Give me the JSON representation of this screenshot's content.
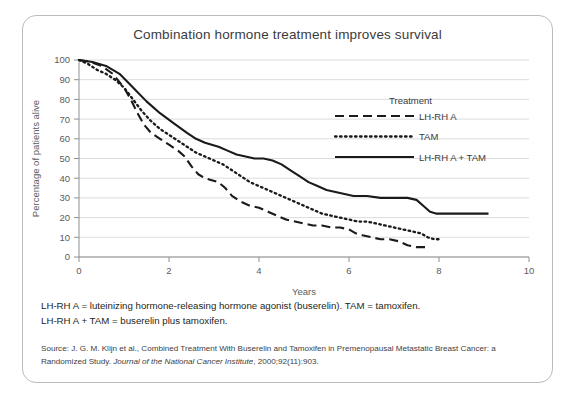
{
  "chart_data": {
    "type": "line",
    "title": "Combination hormone treatment improves survival",
    "xlabel": "Years",
    "ylabel": "Percentage of patients alive",
    "xlim": [
      0,
      10
    ],
    "ylim": [
      0,
      100
    ],
    "xticks": [
      0,
      2,
      4,
      6,
      8,
      10
    ],
    "yticks": [
      0,
      10,
      20,
      30,
      40,
      50,
      60,
      70,
      80,
      90,
      100
    ],
    "grid": "horizontal",
    "legend_position": "upper-right-inside",
    "legend_title": "Treatment",
    "series": [
      {
        "name": "LH-RH A",
        "dash": "dashed",
        "points": [
          [
            0.0,
            100
          ],
          [
            0.25,
            99
          ],
          [
            0.5,
            97
          ],
          [
            0.75,
            93
          ],
          [
            1.0,
            86
          ],
          [
            1.15,
            80
          ],
          [
            1.3,
            73
          ],
          [
            1.45,
            67
          ],
          [
            1.6,
            63
          ],
          [
            1.8,
            60
          ],
          [
            2.0,
            57
          ],
          [
            2.2,
            54
          ],
          [
            2.35,
            51
          ],
          [
            2.5,
            46
          ],
          [
            2.65,
            42
          ],
          [
            2.8,
            40
          ],
          [
            2.95,
            39
          ],
          [
            3.1,
            38
          ],
          [
            3.25,
            35
          ],
          [
            3.4,
            31
          ],
          [
            3.6,
            28
          ],
          [
            3.8,
            26
          ],
          [
            4.0,
            25
          ],
          [
            4.2,
            23
          ],
          [
            4.4,
            21
          ],
          [
            4.6,
            19
          ],
          [
            4.8,
            18
          ],
          [
            5.0,
            17
          ],
          [
            5.2,
            16
          ],
          [
            5.4,
            16
          ],
          [
            5.6,
            15
          ],
          [
            5.8,
            15
          ],
          [
            6.0,
            14
          ],
          [
            6.15,
            12
          ],
          [
            6.3,
            11
          ],
          [
            6.5,
            10
          ],
          [
            6.7,
            9
          ],
          [
            6.9,
            9
          ],
          [
            7.1,
            8
          ],
          [
            7.3,
            6
          ],
          [
            7.5,
            5
          ],
          [
            7.7,
            5
          ]
        ]
      },
      {
        "name": "TAM",
        "dash": "dotted",
        "points": [
          [
            0.0,
            100
          ],
          [
            0.2,
            98
          ],
          [
            0.4,
            95
          ],
          [
            0.6,
            93
          ],
          [
            0.8,
            90
          ],
          [
            1.0,
            86
          ],
          [
            1.2,
            80
          ],
          [
            1.4,
            74
          ],
          [
            1.6,
            69
          ],
          [
            1.8,
            65
          ],
          [
            2.0,
            62
          ],
          [
            2.2,
            59
          ],
          [
            2.4,
            56
          ],
          [
            2.6,
            53
          ],
          [
            2.8,
            51
          ],
          [
            3.0,
            49
          ],
          [
            3.2,
            47
          ],
          [
            3.4,
            44
          ],
          [
            3.6,
            41
          ],
          [
            3.8,
            38
          ],
          [
            4.0,
            36
          ],
          [
            4.2,
            34
          ],
          [
            4.4,
            32
          ],
          [
            4.6,
            30
          ],
          [
            4.8,
            28
          ],
          [
            5.0,
            26
          ],
          [
            5.2,
            24
          ],
          [
            5.4,
            22
          ],
          [
            5.6,
            21
          ],
          [
            5.8,
            20
          ],
          [
            6.0,
            19
          ],
          [
            6.2,
            18
          ],
          [
            6.4,
            18
          ],
          [
            6.6,
            17
          ],
          [
            6.8,
            16
          ],
          [
            7.0,
            15
          ],
          [
            7.2,
            14
          ],
          [
            7.4,
            13
          ],
          [
            7.6,
            12
          ],
          [
            7.75,
            10
          ],
          [
            7.9,
            9
          ],
          [
            8.05,
            9
          ]
        ]
      },
      {
        "name": "LH-RH A + TAM",
        "dash": "solid",
        "points": [
          [
            0.0,
            100
          ],
          [
            0.3,
            99
          ],
          [
            0.6,
            97
          ],
          [
            0.9,
            93
          ],
          [
            1.2,
            86
          ],
          [
            1.5,
            79
          ],
          [
            1.8,
            73
          ],
          [
            2.1,
            68
          ],
          [
            2.4,
            63
          ],
          [
            2.6,
            60
          ],
          [
            2.8,
            58
          ],
          [
            2.95,
            57
          ],
          [
            3.1,
            56
          ],
          [
            3.3,
            54
          ],
          [
            3.5,
            52
          ],
          [
            3.7,
            51
          ],
          [
            3.9,
            50
          ],
          [
            4.1,
            50
          ],
          [
            4.3,
            49
          ],
          [
            4.5,
            47
          ],
          [
            4.7,
            44
          ],
          [
            4.9,
            41
          ],
          [
            5.1,
            38
          ],
          [
            5.3,
            36
          ],
          [
            5.5,
            34
          ],
          [
            5.7,
            33
          ],
          [
            5.9,
            32
          ],
          [
            6.1,
            31
          ],
          [
            6.4,
            31
          ],
          [
            6.7,
            30
          ],
          [
            7.0,
            30
          ],
          [
            7.3,
            30
          ],
          [
            7.5,
            29
          ],
          [
            7.65,
            26
          ],
          [
            7.8,
            23
          ],
          [
            7.95,
            22
          ],
          [
            8.2,
            22
          ],
          [
            8.5,
            22
          ],
          [
            8.8,
            22
          ],
          [
            9.1,
            22
          ]
        ]
      }
    ]
  },
  "notes": {
    "line1": "LH-RH A = luteinizing hormone-releasing hormone agonist (buserelin). TAM = tamoxifen.",
    "line2": "LH-RH A + TAM = buserelin plus tamoxifen."
  },
  "source": {
    "prefix": "Source: J. G. M. Klijn et al., Combined Treatment With Buserelin and Tamoxifen in Premenopausal Metastatic Breast Cancer: a Randomized Study. ",
    "journal": "Journal of the National Cancer Institute",
    "suffix": ", 2000;92(11):903."
  },
  "colors": {
    "line": "#1a1a1a",
    "grid": "#d7d8da",
    "axis": "#8d9092",
    "text": "#231f20",
    "border": "#b9bcbe"
  }
}
